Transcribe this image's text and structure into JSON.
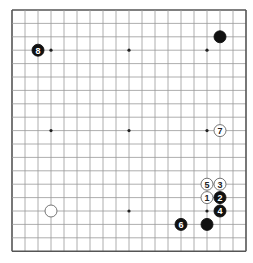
{
  "board": {
    "size": 19,
    "origin_x": 12,
    "origin_y": 10,
    "spacing_x": 13,
    "spacing_y": 13.4,
    "stone_radius": 6,
    "line_color": "#999999",
    "edge_color": "#555555",
    "background": "#ffffff",
    "star_points": [
      [
        3,
        3
      ],
      [
        9,
        3
      ],
      [
        15,
        3
      ],
      [
        3,
        9
      ],
      [
        9,
        9
      ],
      [
        15,
        9
      ],
      [
        3,
        15
      ],
      [
        9,
        15
      ],
      [
        15,
        15
      ]
    ]
  },
  "stones": [
    {
      "color": "black",
      "col": 16,
      "row": 2,
      "label": ""
    },
    {
      "color": "white",
      "col": 3,
      "row": 15,
      "label": ""
    },
    {
      "color": "black",
      "col": 15,
      "row": 16,
      "label": ""
    },
    {
      "color": "white",
      "col": 15,
      "row": 14,
      "label": "1"
    },
    {
      "color": "black",
      "col": 16,
      "row": 14,
      "label": "2"
    },
    {
      "color": "white",
      "col": 16,
      "row": 13,
      "label": "3"
    },
    {
      "color": "black",
      "col": 16,
      "row": 15,
      "label": "4"
    },
    {
      "color": "white",
      "col": 15,
      "row": 13,
      "label": "5"
    },
    {
      "color": "black",
      "col": 13,
      "row": 16,
      "label": "6"
    },
    {
      "color": "white",
      "col": 16,
      "row": 9,
      "label": "7"
    },
    {
      "color": "black",
      "col": 2,
      "row": 3,
      "label": "8"
    }
  ]
}
